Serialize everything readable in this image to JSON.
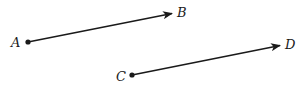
{
  "diagram": {
    "type": "vectors",
    "colors": {
      "stroke": "#1a1a1a",
      "background": "#ffffff"
    },
    "vectors": [
      {
        "name": "AB",
        "from": {
          "label": "A",
          "x": 28,
          "y": 42
        },
        "to": {
          "label": "B",
          "x": 172,
          "y": 13
        }
      },
      {
        "name": "CD",
        "from": {
          "label": "C",
          "x": 132,
          "y": 75
        },
        "to": {
          "label": "D",
          "x": 280,
          "y": 45
        }
      }
    ],
    "labels": {
      "A": "A",
      "B": "B",
      "C": "C",
      "D": "D"
    }
  }
}
